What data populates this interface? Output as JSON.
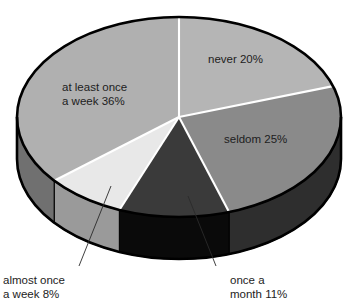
{
  "chart_data": {
    "type": "pie",
    "title": "",
    "subtitle": "",
    "xlabel": "",
    "ylabel": "",
    "legend_position": "none",
    "grid": false,
    "style": "3d-pie",
    "start_angle_deg": 0,
    "direction": "clockwise",
    "units": "percent",
    "total": 100,
    "categories": [
      "never",
      "seldom",
      "once a month",
      "almost once a week",
      "at least once a week"
    ],
    "values": [
      20,
      25,
      11,
      8,
      36
    ],
    "slices": [
      {
        "name": "never",
        "label_text": "never 20%",
        "label_lines": [
          "never 20%"
        ],
        "value": 20,
        "color": "#b5b5b5",
        "side_color": "#4a4a4a",
        "label_placement": "inside",
        "label_x": 208,
        "label_y": 60
      },
      {
        "name": "seldom",
        "label_text": "seldom 25%",
        "label_lines": [
          "seldom 25%"
        ],
        "value": 25,
        "color": "#8a8a8a",
        "side_color": "#2e2e2e",
        "label_placement": "inside",
        "label_x": 224,
        "label_y": 140
      },
      {
        "name": "once a month",
        "label_text": "once a month 11%",
        "label_lines": [
          "once a",
          "month 11%"
        ],
        "value": 11,
        "color": "#3a3a3a",
        "side_color": "#0a0a0a",
        "label_placement": "callout",
        "label_x": 230,
        "label_y": 281
      },
      {
        "name": "almost once a week",
        "label_text": "almost once a week 8%",
        "label_lines": [
          "almost once",
          "a week 8%"
        ],
        "value": 8,
        "color": "#e8e8e8",
        "side_color": "#9a9a9a",
        "label_placement": "callout",
        "label_x": 3,
        "label_y": 281
      },
      {
        "name": "at least once a week",
        "label_text": "at least once a week 36%",
        "label_lines": [
          "at least once",
          "a week 36%"
        ],
        "value": 36,
        "color": "#b0b0b0",
        "side_color": "#707070",
        "label_placement": "inside",
        "label_x": 62,
        "label_y": 88
      }
    ],
    "geometry": {
      "center_x": 179,
      "center_y": 117,
      "radius_x": 162,
      "radius_y": 100,
      "depth": 42
    },
    "colors": {
      "outline": "#000000",
      "divider": "#ffffff",
      "background": "#ffffff",
      "text": "#1d1d1d",
      "leader": "#2a2a2a"
    }
  }
}
